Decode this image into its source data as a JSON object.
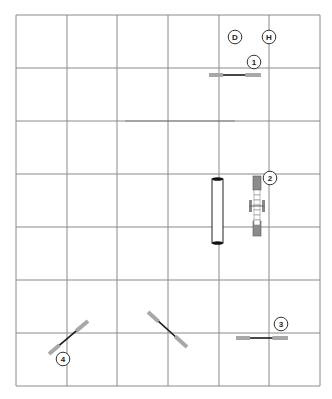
{
  "diagram": {
    "type": "floor-layout-grid",
    "colors": {
      "grid_line": "#8a8a8a",
      "bar_end": "#a8a8a8",
      "bar_center": "#1a1a1a",
      "label_stroke": "#333333",
      "label_text": "#222222",
      "shadow_line": "#555555"
    },
    "grid": {
      "columns": [
        16,
        67,
        117,
        168,
        219,
        269,
        320
      ],
      "rows": [
        15,
        68,
        121,
        174,
        227,
        280,
        333,
        386
      ]
    },
    "markers": [
      {
        "id": "D",
        "label": "D",
        "cx": 235,
        "cy": 37
      },
      {
        "id": "H",
        "label": "H",
        "cx": 269,
        "cy": 37
      }
    ],
    "station_labels": [
      {
        "id": "1",
        "label": "1",
        "cx": 254,
        "cy": 62
      },
      {
        "id": "2",
        "label": "2",
        "cx": 270,
        "cy": 178
      },
      {
        "id": "3",
        "label": "3",
        "cx": 281,
        "cy": 324
      },
      {
        "id": "4",
        "label": "4",
        "cx": 63,
        "cy": 359
      }
    ],
    "bars": [
      {
        "id": "bar-1",
        "x1": 209,
        "y1": 75,
        "x2": 261,
        "y2": 75
      },
      {
        "id": "bar-3",
        "x1": 236,
        "y1": 338,
        "x2": 288,
        "y2": 338
      },
      {
        "id": "bar-4",
        "x1": 49,
        "y1": 354,
        "x2": 88,
        "y2": 321
      },
      {
        "id": "bar-unlabeled",
        "x1": 148,
        "y1": 312,
        "x2": 187,
        "y2": 347
      }
    ],
    "cylinder": {
      "x": 212,
      "y": 179,
      "width": 11,
      "height": 64
    },
    "vertical_barbell": {
      "x": 253,
      "y": 176,
      "width": 8,
      "height": 60,
      "handle_y": 200,
      "handle_height": 12,
      "handle_x1": 249,
      "handle_x2": 265
    }
  }
}
